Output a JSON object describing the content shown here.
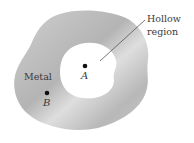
{
  "diagram": {
    "labels": {
      "metal": "Metal",
      "hollow_line1": "Hollow",
      "hollow_line2": "region",
      "point_a": "A",
      "point_b": "B"
    },
    "colors": {
      "metal_fill": "#bdbdbd",
      "metal_highlight": "#e2e2e2",
      "hollow_fill": "#ffffff",
      "point": "#111111",
      "leader_line": "#555555",
      "text": "#3a3a3a"
    },
    "points": [
      {
        "name": "A",
        "x": 85,
        "y": 66,
        "region": "hollow"
      },
      {
        "name": "B",
        "x": 47,
        "y": 93,
        "region": "metal"
      }
    ]
  }
}
